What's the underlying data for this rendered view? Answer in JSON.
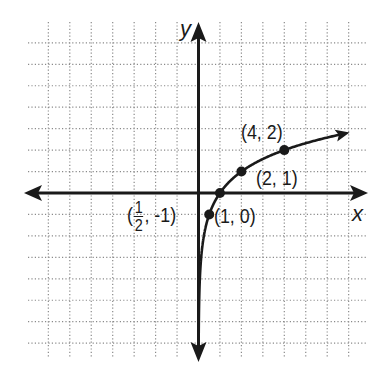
{
  "chart_data": {
    "type": "line",
    "title": "",
    "function": "y = log2(x)",
    "xlabel": "x",
    "ylabel": "y",
    "xlim": [
      -7,
      7
    ],
    "ylim": [
      -7,
      7
    ],
    "grid": true,
    "grid_style": "dotted",
    "grid_step": 1,
    "legend": null,
    "series": [
      {
        "name": "y = log2(x)",
        "x": [
          0.0078,
          0.0156,
          0.03125,
          0.0625,
          0.125,
          0.25,
          0.5,
          1,
          2,
          4,
          6.5
        ],
        "y": [
          -7,
          -6,
          -5,
          -4,
          -3,
          -2,
          -1,
          0,
          1,
          2,
          2.7
        ]
      }
    ],
    "labeled_points": [
      {
        "x": 0.5,
        "y": -1,
        "label_prefix": "(",
        "label_num": "1",
        "label_den": "2",
        "label_suffix": ", -1)"
      },
      {
        "x": 1,
        "y": 0,
        "label": "(1, 0)"
      },
      {
        "x": 2,
        "y": 1,
        "label": "(2, 1)"
      },
      {
        "x": 4,
        "y": 2,
        "label": "(4, 2)"
      }
    ],
    "colors": {
      "curve": "#1a1a1a",
      "axes": "#1a1a1a",
      "grid": "#8a8a8a"
    }
  }
}
